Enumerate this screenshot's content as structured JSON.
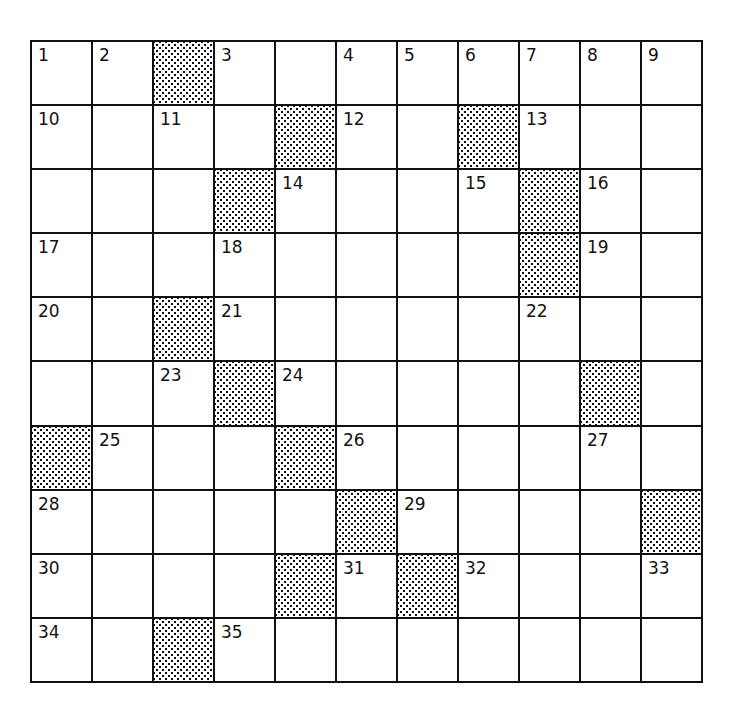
{
  "puzzle": {
    "rows": 10,
    "cols": 11,
    "blocks": [
      [
        0,
        2
      ],
      [
        1,
        4
      ],
      [
        1,
        7
      ],
      [
        2,
        3
      ],
      [
        2,
        8
      ],
      [
        3,
        8
      ],
      [
        4,
        2
      ],
      [
        5,
        3
      ],
      [
        5,
        9
      ],
      [
        6,
        0
      ],
      [
        6,
        4
      ],
      [
        7,
        5
      ],
      [
        7,
        10
      ],
      [
        8,
        4
      ],
      [
        8,
        6
      ],
      [
        9,
        2
      ]
    ],
    "numbers": [
      {
        "r": 0,
        "c": 0,
        "n": "1"
      },
      {
        "r": 0,
        "c": 1,
        "n": "2"
      },
      {
        "r": 0,
        "c": 3,
        "n": "3"
      },
      {
        "r": 0,
        "c": 5,
        "n": "4"
      },
      {
        "r": 0,
        "c": 6,
        "n": "5"
      },
      {
        "r": 0,
        "c": 7,
        "n": "6"
      },
      {
        "r": 0,
        "c": 8,
        "n": "7"
      },
      {
        "r": 0,
        "c": 9,
        "n": "8"
      },
      {
        "r": 0,
        "c": 10,
        "n": "9"
      },
      {
        "r": 1,
        "c": 0,
        "n": "10"
      },
      {
        "r": 1,
        "c": 2,
        "n": "11"
      },
      {
        "r": 1,
        "c": 5,
        "n": "12"
      },
      {
        "r": 1,
        "c": 8,
        "n": "13"
      },
      {
        "r": 2,
        "c": 4,
        "n": "14"
      },
      {
        "r": 2,
        "c": 7,
        "n": "15"
      },
      {
        "r": 2,
        "c": 9,
        "n": "16"
      },
      {
        "r": 3,
        "c": 0,
        "n": "17"
      },
      {
        "r": 3,
        "c": 3,
        "n": "18"
      },
      {
        "r": 3,
        "c": 9,
        "n": "19"
      },
      {
        "r": 4,
        "c": 0,
        "n": "20"
      },
      {
        "r": 4,
        "c": 3,
        "n": "21"
      },
      {
        "r": 4,
        "c": 8,
        "n": "22"
      },
      {
        "r": 5,
        "c": 2,
        "n": "23"
      },
      {
        "r": 5,
        "c": 4,
        "n": "24"
      },
      {
        "r": 6,
        "c": 1,
        "n": "25"
      },
      {
        "r": 6,
        "c": 5,
        "n": "26"
      },
      {
        "r": 6,
        "c": 9,
        "n": "27"
      },
      {
        "r": 7,
        "c": 0,
        "n": "28"
      },
      {
        "r": 7,
        "c": 6,
        "n": "29"
      },
      {
        "r": 8,
        "c": 0,
        "n": "30"
      },
      {
        "r": 8,
        "c": 5,
        "n": "31"
      },
      {
        "r": 8,
        "c": 7,
        "n": "32"
      },
      {
        "r": 8,
        "c": 10,
        "n": "33"
      },
      {
        "r": 9,
        "c": 0,
        "n": "34"
      },
      {
        "r": 9,
        "c": 3,
        "n": "35"
      }
    ]
  }
}
